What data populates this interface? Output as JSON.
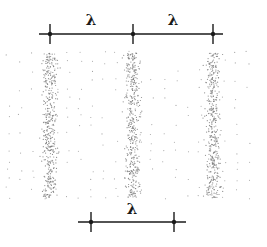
{
  "diagram": {
    "colors": {
      "line": "#1a1a1a",
      "dot": "#7a7a7a",
      "background": "#ffffff"
    },
    "top_scale": {
      "y": 34,
      "x_start": 39,
      "x_end": 223,
      "ticks": [
        50,
        133,
        213
      ],
      "tick_half_height": 10,
      "labels": [
        {
          "text": "λ",
          "x": 91,
          "y": 25
        },
        {
          "text": "λ",
          "x": 173,
          "y": 25
        }
      ]
    },
    "bottom_scale": {
      "y": 222,
      "x_start": 78,
      "x_end": 186,
      "ticks": [
        91,
        174
      ],
      "tick_half_height": 10,
      "labels": [
        {
          "text": "λ",
          "x": 132,
          "y": 214
        }
      ]
    },
    "dot_field": {
      "x_min": 8,
      "x_max": 258,
      "y_min": 53,
      "y_max": 198,
      "band_centers": [
        50,
        133,
        213
      ],
      "band_half_width": 10,
      "band_dot_count": 420,
      "background_spacing": 9,
      "seed": 7
    }
  }
}
